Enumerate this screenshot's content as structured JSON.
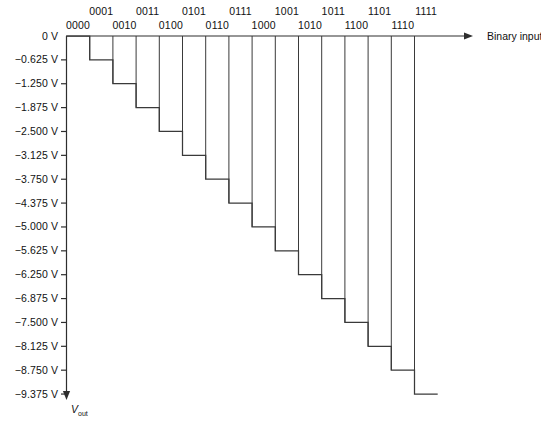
{
  "chart_data": {
    "type": "line",
    "title": "",
    "xlabel": "Binary input",
    "ylabel": "Vout",
    "ylabel_html": "V",
    "ylabel_sub": "out",
    "categories": [
      "0000",
      "0001",
      "0010",
      "0011",
      "0100",
      "0101",
      "0110",
      "0111",
      "1000",
      "1001",
      "1010",
      "1011",
      "1100",
      "1101",
      "1110",
      "1111"
    ],
    "values": [
      0,
      -0.625,
      -1.25,
      -1.875,
      -2.5,
      -3.125,
      -3.75,
      -4.375,
      -5.0,
      -5.625,
      -6.25,
      -6.875,
      -7.5,
      -8.125,
      -8.75,
      -9.375
    ],
    "ytick_labels": [
      "0 V",
      "−0.625 V",
      "−1.250 V",
      "−1.875 V",
      "−2.500 V",
      "−3.125 V",
      "−3.750 V",
      "−4.375 V",
      "−5.000 V",
      "−5.625 V",
      "−6.250 V",
      "−6.875 V",
      "−7.500 V",
      "−8.125 V",
      "−8.750 V",
      "−9.375 V"
    ],
    "ylim": [
      -9.375,
      0
    ],
    "step_volts": -0.625,
    "grid": false,
    "legend": null,
    "line_color": "#3a3a3a",
    "axis_color": "#2e2e2e"
  },
  "axes": {
    "x_axis_title": "Binary input",
    "y_axis_title_main": "V",
    "y_axis_title_sub": "out"
  }
}
